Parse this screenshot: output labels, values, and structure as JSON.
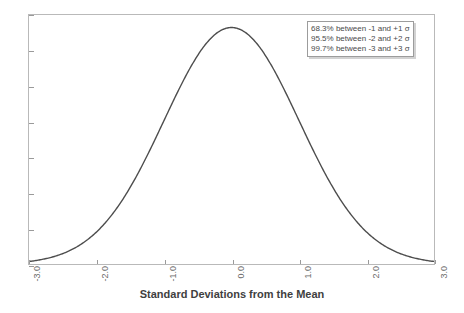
{
  "chart_data": {
    "type": "line",
    "title": "",
    "subtitle": "",
    "xlabel": "Standard Deviations from the Mean",
    "ylabel": "",
    "xlim": [
      -3.0,
      3.0
    ],
    "ylim": [
      0,
      0.42
    ],
    "grid": false,
    "legend_position": "top-right",
    "series": [
      {
        "name": "Standard Normal Distribution",
        "color": "#4d4d4d",
        "x": [
          -3.0,
          -2.8,
          -2.6,
          -2.4,
          -2.2,
          -2.0,
          -1.8,
          -1.6,
          -1.4,
          -1.2,
          -1.0,
          -0.8,
          -0.6,
          -0.4,
          -0.2,
          0.0,
          0.2,
          0.4,
          0.6,
          0.8,
          1.0,
          1.2,
          1.4,
          1.6,
          1.8,
          2.0,
          2.2,
          2.4,
          2.6,
          2.8,
          3.0
        ],
        "values": [
          0.0044,
          0.0079,
          0.0136,
          0.0224,
          0.0355,
          0.054,
          0.079,
          0.1109,
          0.1497,
          0.1942,
          0.242,
          0.2897,
          0.3332,
          0.3683,
          0.391,
          0.3989,
          0.391,
          0.3683,
          0.3332,
          0.2897,
          0.242,
          0.1942,
          0.1497,
          0.1109,
          0.079,
          0.054,
          0.0355,
          0.0224,
          0.0136,
          0.0079,
          0.0044
        ]
      }
    ],
    "xticks": [
      {
        "value": -3.0,
        "label": "-3.0"
      },
      {
        "value": -2.0,
        "label": "-2.0"
      },
      {
        "value": -1.0,
        "label": "-1.0"
      },
      {
        "value": 0.0,
        "label": "0.0"
      },
      {
        "value": 1.0,
        "label": "1.0"
      },
      {
        "value": 2.0,
        "label": "2.0"
      },
      {
        "value": 3.0,
        "label": "3.0"
      }
    ],
    "yticks": [
      {
        "value": 0.0,
        "label": ""
      },
      {
        "value": 0.06,
        "label": ""
      },
      {
        "value": 0.12,
        "label": ""
      },
      {
        "value": 0.18,
        "label": ""
      },
      {
        "value": 0.24,
        "label": ""
      },
      {
        "value": 0.3,
        "label": ""
      },
      {
        "value": 0.36,
        "label": ""
      },
      {
        "value": 0.42,
        "label": ""
      }
    ],
    "annotations": [
      "68.3% between -1 and +1 σ",
      "95.5% between -2 and +2 σ",
      "99.7% between -3 and +3 σ"
    ]
  },
  "legend": {
    "lines": [
      "68.3% between -1 and +1 σ",
      "95.5% between -2 and +2 σ",
      "99.7% between -3 and +3 σ"
    ]
  },
  "axis": {
    "x_title": "Standard Deviations from the Mean"
  },
  "colors": {
    "curve": "#4d4d4d",
    "frame": "#b9b9b9",
    "tick": "#9a9a9a",
    "legend_border": "#9c9c9c",
    "legend_shadow": "#d2d2d2",
    "background": "#ffffff"
  }
}
